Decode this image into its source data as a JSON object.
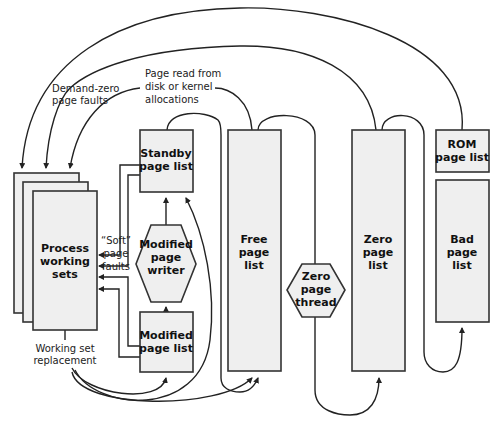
{
  "diagram": {
    "nodes": {
      "process_working_sets": {
        "lines": [
          "Process",
          "working",
          "sets"
        ]
      },
      "standby_page_list": {
        "lines": [
          "Standby",
          "page list"
        ]
      },
      "modified_page_writer": {
        "lines": [
          "Modified",
          "page",
          "writer"
        ]
      },
      "modified_page_list": {
        "lines": [
          "Modified",
          "page list"
        ]
      },
      "free_page_list": {
        "lines": [
          "Free",
          "page",
          "list"
        ]
      },
      "zero_page_thread": {
        "lines": [
          "Zero",
          "page",
          "thread"
        ]
      },
      "zero_page_list": {
        "lines": [
          "Zero",
          "page",
          "list"
        ]
      },
      "rom_page_list": {
        "lines": [
          "ROM",
          "page list"
        ]
      },
      "bad_page_list": {
        "lines": [
          "Bad",
          "page",
          "list"
        ]
      }
    },
    "annotations": {
      "demand_zero": [
        "Demand-zero",
        "page faults"
      ],
      "page_read": [
        "Page read from",
        "disk or kernel",
        "allocations"
      ],
      "soft_faults": [
        "“Soft”",
        "page",
        "faults"
      ],
      "ws_replacement": [
        "Working set",
        "replacement"
      ]
    },
    "colors": {
      "box_fill": "#efefef",
      "stroke": "#333333",
      "background": "#ffffff"
    }
  }
}
